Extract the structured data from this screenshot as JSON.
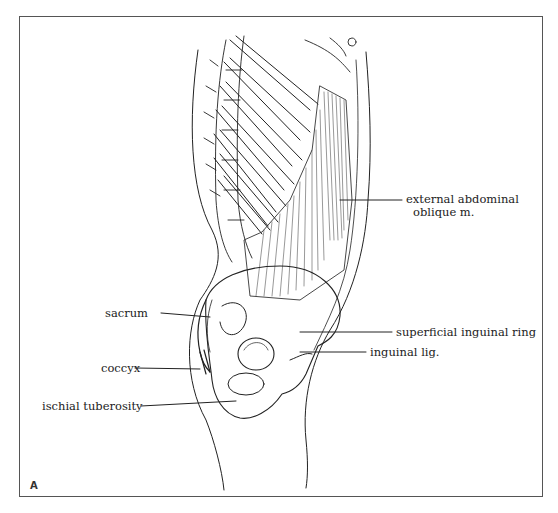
{
  "figure": {
    "panel_letter": "A",
    "colors": {
      "line": "#222222",
      "frame": "#555555",
      "background": "#ffffff"
    }
  },
  "labels": {
    "external_oblique_line1": "external abdominal",
    "external_oblique_line2": "oblique m.",
    "superficial_inguinal_ring": "superficial inguinal ring",
    "inguinal_lig": "inguinal lig.",
    "sacrum": "sacrum",
    "coccyx": "coccyx",
    "ischial_tuberosity": "ischial tuberosity"
  }
}
